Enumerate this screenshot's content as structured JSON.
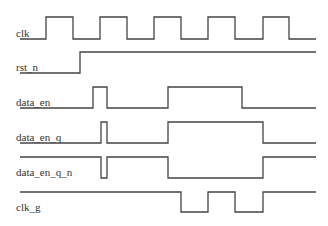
{
  "diagram": {
    "type": "timing",
    "stroke_color": "#444444",
    "signals": [
      {
        "name": "clk",
        "label_y": 37,
        "points": [
          [
            20,
            39
          ],
          [
            46,
            39
          ],
          [
            46,
            17
          ],
          [
            73,
            17
          ],
          [
            73,
            39
          ],
          [
            100,
            39
          ],
          [
            100,
            17
          ],
          [
            127,
            17
          ],
          [
            127,
            39
          ],
          [
            154,
            39
          ],
          [
            154,
            17
          ],
          [
            181,
            17
          ],
          [
            181,
            39
          ],
          [
            208,
            39
          ],
          [
            208,
            17
          ],
          [
            235,
            17
          ],
          [
            235,
            39
          ],
          [
            263,
            39
          ],
          [
            263,
            17
          ],
          [
            289,
            17
          ],
          [
            289,
            39
          ],
          [
            316,
            39
          ]
        ]
      },
      {
        "name": "rst_n",
        "label_y": 71,
        "points": [
          [
            20,
            73
          ],
          [
            80,
            73
          ],
          [
            80,
            52
          ],
          [
            316,
            52
          ]
        ]
      },
      {
        "name": "data_en",
        "label_y": 106,
        "points": [
          [
            20,
            108
          ],
          [
            93,
            108
          ],
          [
            93,
            87
          ],
          [
            107,
            87
          ],
          [
            107,
            108
          ],
          [
            168,
            108
          ],
          [
            168,
            87
          ],
          [
            242,
            87
          ],
          [
            242,
            108
          ],
          [
            316,
            108
          ]
        ]
      },
      {
        "name": "data_en_q",
        "label_y": 141,
        "points": [
          [
            20,
            143
          ],
          [
            101,
            143
          ],
          [
            101,
            122
          ],
          [
            107,
            122
          ],
          [
            107,
            143
          ],
          [
            168,
            143
          ],
          [
            168,
            122
          ],
          [
            263,
            122
          ],
          [
            263,
            143
          ],
          [
            316,
            143
          ]
        ]
      },
      {
        "name": "data_en_q_n",
        "label_y": 176,
        "points": [
          [
            20,
            157
          ],
          [
            101,
            157
          ],
          [
            101,
            178
          ],
          [
            107,
            178
          ],
          [
            107,
            157
          ],
          [
            168,
            157
          ],
          [
            168,
            178
          ],
          [
            263,
            178
          ],
          [
            263,
            157
          ],
          [
            316,
            157
          ]
        ]
      },
      {
        "name": "clk_g",
        "label_y": 211,
        "points": [
          [
            20,
            192
          ],
          [
            181,
            192
          ],
          [
            181,
            212
          ],
          [
            208,
            212
          ],
          [
            208,
            192
          ],
          [
            235,
            192
          ],
          [
            235,
            212
          ],
          [
            263,
            212
          ],
          [
            263,
            192
          ],
          [
            316,
            192
          ]
        ]
      }
    ]
  }
}
